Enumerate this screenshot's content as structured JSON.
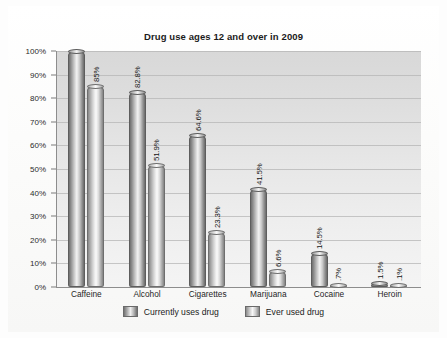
{
  "chart_data": {
    "type": "bar",
    "title": "Drug use ages 12 and over in 2009",
    "xlabel": "",
    "ylabel": "",
    "ylim": [
      0,
      100
    ],
    "grid": true,
    "legend_position": "bottom",
    "categories": [
      "Caffeine",
      "Alcohol",
      "Cigarettes",
      "Marijuana",
      "Cocaine",
      "Heroin"
    ],
    "tick_labels": [
      "0%",
      "10%",
      "20%",
      "30%",
      "40%",
      "50%",
      "60%",
      "70%",
      "80%",
      "90%",
      "100%"
    ],
    "tick_values": [
      0,
      10,
      20,
      30,
      40,
      50,
      60,
      70,
      80,
      90,
      100
    ],
    "series": [
      {
        "name": "Currently uses drug",
        "values": [
          100,
          82.8,
          64.6,
          41.5,
          14.5,
          1.5
        ],
        "labels": [
          "",
          "82.8%",
          "64.6%",
          "41.5%",
          "14.5%",
          "1.5%"
        ]
      },
      {
        "name": "Ever used drug",
        "values": [
          85,
          51.9,
          23.3,
          6.6,
          0.7,
          0.1
        ],
        "labels": [
          "85%",
          "51.9%",
          "23.3%",
          "6.6%",
          ".7%",
          ".1%"
        ]
      }
    ]
  },
  "legend": {
    "items": [
      {
        "label": "Currently uses drug",
        "swatch": "series-1-swatch"
      },
      {
        "label": "Ever used drug",
        "swatch": "series-2-swatch"
      }
    ]
  },
  "colors": {
    "plot_background": "#e4e4e4",
    "gridline": "#b5b5b5",
    "axis": "#8d8d8d",
    "series_1": "#8c8c8c",
    "series_2": "#c4c4c4",
    "text": "#1b1b1b"
  }
}
